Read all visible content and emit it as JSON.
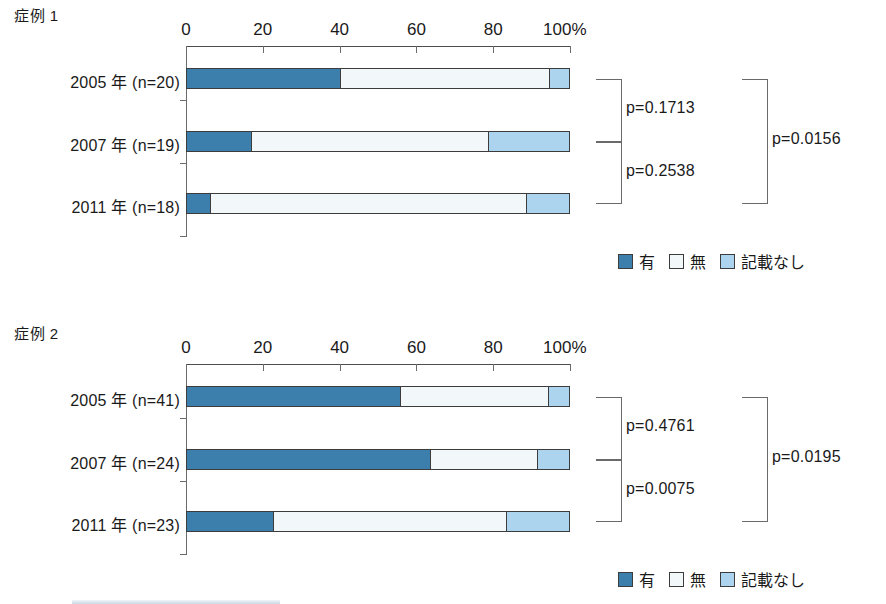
{
  "colors": {
    "present": "#3c7fad",
    "absent": "#f2f8fa",
    "unstated": "#acd4ee",
    "outline": "#3c3c3c",
    "axis": "#6b6b6b"
  },
  "legend": {
    "items": [
      {
        "label": "有",
        "key": "present"
      },
      {
        "label": "無",
        "key": "absent"
      },
      {
        "label": "記載なし",
        "key": "unstated"
      }
    ]
  },
  "axis": {
    "ticks": [
      "0",
      "20",
      "40",
      "60",
      "80",
      "100%"
    ],
    "tick_values": [
      0,
      20,
      40,
      60,
      80,
      100
    ],
    "min": 0,
    "max": 100
  },
  "panels": [
    {
      "title": "症例 1",
      "rows": [
        {
          "label": "2005 年 (n=20)",
          "present": 40,
          "absent": 55,
          "unstated": 5
        },
        {
          "label": "2007 年 (n=19)",
          "present": 16.7,
          "absent": 62.3,
          "unstated": 21
        },
        {
          "label": "2011 年 (n=18)",
          "present": 6,
          "absent": 83,
          "unstated": 11
        }
      ],
      "pvalues": {
        "top_pair": "p=0.1713",
        "bottom_pair": "p=0.2538",
        "overall": "p=0.0156"
      }
    },
    {
      "title": "症例 2",
      "rows": [
        {
          "label": "2005 年 (n=41)",
          "present": 55.7,
          "absent": 39.1,
          "unstated": 5.2
        },
        {
          "label": "2007 年 (n=24)",
          "present": 63.5,
          "absent": 28.4,
          "unstated": 8.1
        },
        {
          "label": "2011 年 (n=23)",
          "present": 22.4,
          "absent": 61.4,
          "unstated": 16.2
        }
      ],
      "pvalues": {
        "top_pair": "p=0.4761",
        "bottom_pair": "p=0.0075",
        "overall": "p=0.0195"
      }
    }
  ],
  "chart_data": {
    "type": "bar",
    "subtype": "stacked-horizontal-100pct",
    "title": "",
    "xlabel": "%",
    "ylabel": "",
    "xlim": [
      0,
      100
    ],
    "xticks": [
      0,
      20,
      40,
      60,
      80,
      100
    ],
    "xticklabels": [
      "0",
      "20",
      "40",
      "60",
      "80",
      "100%"
    ],
    "grid": false,
    "legend_position": "bottom-right",
    "legend_entries": [
      "有",
      "無",
      "記載なし"
    ],
    "charts": [
      {
        "title": "症例 1",
        "categories": [
          "2005 年 (n=20)",
          "2007 年 (n=19)",
          "2011 年 (n=18)"
        ],
        "series": [
          {
            "name": "有",
            "values": [
              40,
              16.7,
              6
            ]
          },
          {
            "name": "無",
            "values": [
              55,
              62.3,
              83
            ]
          },
          {
            "name": "記載なし",
            "values": [
              5,
              21,
              11
            ]
          }
        ],
        "annotations": [
          {
            "text": "p=0.1713",
            "compares": [
              "2005 年 (n=20)",
              "2007 年 (n=19)"
            ]
          },
          {
            "text": "p=0.2538",
            "compares": [
              "2007 年 (n=19)",
              "2011 年 (n=18)"
            ]
          },
          {
            "text": "p=0.0156",
            "compares": [
              "2005 年 (n=20)",
              "2011 年 (n=18)"
            ]
          }
        ]
      },
      {
        "title": "症例 2",
        "categories": [
          "2005 年 (n=41)",
          "2007 年 (n=24)",
          "2011 年 (n=23)"
        ],
        "series": [
          {
            "name": "有",
            "values": [
              55.7,
              63.5,
              22.4
            ]
          },
          {
            "name": "無",
            "values": [
              39.1,
              28.4,
              61.4
            ]
          },
          {
            "name": "記載なし",
            "values": [
              5.2,
              8.1,
              16.2
            ]
          }
        ],
        "annotations": [
          {
            "text": "p=0.4761",
            "compares": [
              "2005 年 (n=41)",
              "2007 年 (n=24)"
            ]
          },
          {
            "text": "p=0.0075",
            "compares": [
              "2007 年 (n=24)",
              "2011 年 (n=23)"
            ]
          },
          {
            "text": "p=0.0195",
            "compares": [
              "2005 年 (n=41)",
              "2011 年 (n=23)"
            ]
          }
        ]
      }
    ]
  }
}
